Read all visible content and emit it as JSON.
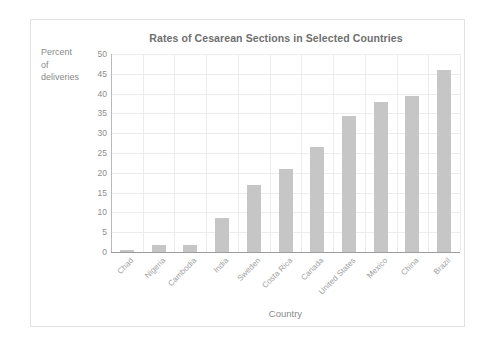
{
  "chart_data": {
    "type": "bar",
    "title": "Rates of Cesarean Sections in Selected Countries",
    "xlabel": "Country",
    "ylabel": "Percent of deliveries",
    "ylabel_lines": [
      "Percent",
      "of",
      "deliveries"
    ],
    "categories": [
      "Chad",
      "Nigeria",
      "Cambodia",
      "India",
      "Sweden",
      "Costa Rica",
      "Canada",
      "United States",
      "Mexico",
      "China",
      "Brazil"
    ],
    "values": [
      0.4,
      1.8,
      1.8,
      8.5,
      17,
      21,
      26.5,
      34.3,
      38,
      39.5,
      46
    ],
    "ylim": [
      0,
      50
    ],
    "yticks": [
      0,
      5,
      10,
      15,
      20,
      25,
      30,
      35,
      40,
      45,
      50
    ],
    "ytick_labels": [
      "0",
      "5",
      "10",
      "15",
      "20",
      "25",
      "30",
      "35",
      "40",
      "45",
      "50"
    ],
    "grid": true,
    "legend": "none",
    "bar_color": "#c6c6c6",
    "grid_color": "#ececec",
    "axis_color": "#9c9c9c",
    "text_color": "#8a8a8a",
    "title_color": "#6f6f6f",
    "frame_color": "#e2e2e2",
    "background": "#ffffff"
  }
}
